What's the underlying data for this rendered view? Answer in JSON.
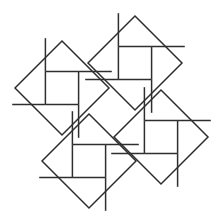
{
  "figure": {
    "background_color": "#ffffff",
    "line_color": "#2e2e2e",
    "line_width": 1.5,
    "canvas": {
      "width": 221,
      "height": 224
    },
    "shape_count": 4,
    "rotation_degrees": 45
  },
  "chart_data": {
    "type": "diagram",
    "units": "pixels",
    "squares": [
      {
        "name": "top-left-square",
        "center": [
          62,
          88
        ],
        "half_diagonal": 47,
        "vertices": [
          [
            62,
            41
          ],
          [
            109,
            88
          ],
          [
            62,
            135
          ],
          [
            15,
            88
          ]
        ],
        "pinwheel_rotation": 0
      },
      {
        "name": "top-right-square",
        "center": [
          135,
          63
        ],
        "half_diagonal": 47,
        "vertices": [
          [
            135,
            16
          ],
          [
            182,
            63
          ],
          [
            135,
            110
          ],
          [
            88,
            63
          ]
        ],
        "pinwheel_rotation": 0
      },
      {
        "name": "bottom-left-square",
        "center": [
          89,
          161
        ],
        "half_diagonal": 47,
        "vertices": [
          [
            89,
            114
          ],
          [
            136,
            161
          ],
          [
            89,
            208
          ],
          [
            42,
            161
          ]
        ],
        "pinwheel_rotation": 0
      },
      {
        "name": "bottom-right-square",
        "center": [
          161,
          137
        ],
        "half_diagonal": 47,
        "vertices": [
          [
            161,
            90
          ],
          [
            208,
            137
          ],
          [
            161,
            184
          ],
          [
            114,
            137
          ]
        ],
        "pinwheel_rotation": 0
      }
    ],
    "pinwheel_motif": {
      "description": "Inside each rotated square, four axis-aligned segments form a pinwheel: each segment runs from an inner offset point to a square edge, producing four congruent rectangles around a central square.",
      "local_segments": [
        {
          "from": [
            -16.6,
            -16.6
          ],
          "to": [
            16.6,
            -16.6
          ]
        },
        {
          "from": [
            16.6,
            -16.6
          ],
          "to": [
            16.6,
            16.6
          ]
        },
        {
          "from": [
            16.6,
            16.6
          ],
          "to": [
            -16.6,
            16.6
          ]
        },
        {
          "from": [
            -16.6,
            16.6
          ],
          "to": [
            -16.6,
            -16.6
          ]
        }
      ],
      "spoke_segments": [
        {
          "from": [
            -16.6,
            -16.6
          ],
          "to": [
            -16.6,
            -49.8
          ]
        },
        {
          "from": [
            16.6,
            -16.6
          ],
          "to": [
            49.8,
            -16.6
          ]
        },
        {
          "from": [
            16.6,
            16.6
          ],
          "to": [
            16.6,
            49.8
          ]
        },
        {
          "from": [
            -16.6,
            16.6
          ],
          "to": [
            -49.8,
            16.6
          ]
        }
      ]
    },
    "legend": [],
    "grid": false
  }
}
